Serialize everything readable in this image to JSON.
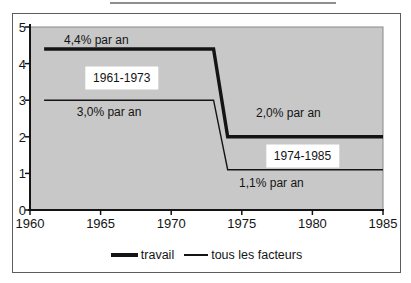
{
  "chart_data": {
    "type": "line",
    "title": "",
    "xlabel": "",
    "ylabel": "",
    "xlim": [
      1960,
      1985
    ],
    "ylim": [
      0,
      5
    ],
    "x_ticks": [
      "1960",
      "1965",
      "1970",
      "1975",
      "1980",
      "1985"
    ],
    "y_ticks": [
      "0",
      "1",
      "2",
      "3",
      "4",
      "5"
    ],
    "grid": false,
    "plot_bg_color": "#c8c8c8",
    "line_color": "#141414",
    "series": [
      {
        "name": "travail",
        "style": "thick",
        "x": [
          1961,
          1973,
          1974,
          1985
        ],
        "y": [
          4.4,
          4.4,
          2.0,
          2.0
        ]
      },
      {
        "name": "tous les facteurs",
        "style": "thin",
        "x": [
          1961,
          1973,
          1974,
          1985
        ],
        "y": [
          3.0,
          3.0,
          1.1,
          1.1
        ]
      }
    ],
    "annotations": [
      {
        "text": "4,4% par an",
        "x": 1964.7,
        "y": 4.64,
        "boxed": false
      },
      {
        "text": "1961-1973",
        "x": 1966.5,
        "y": 3.6,
        "boxed": true
      },
      {
        "text": "3,0% par an",
        "x": 1965.6,
        "y": 2.67,
        "boxed": false
      },
      {
        "text": "2,0% par an",
        "x": 1978.3,
        "y": 2.66,
        "boxed": false
      },
      {
        "text": "1974-1985",
        "x": 1979.3,
        "y": 1.48,
        "boxed": true
      },
      {
        "text": "1,1% par an",
        "x": 1977.1,
        "y": 0.74,
        "boxed": false
      }
    ],
    "legend": [
      {
        "label": "travail",
        "style": "thick"
      },
      {
        "label": "tous les facteurs",
        "style": "thin"
      }
    ],
    "legend_position": "bottom"
  }
}
